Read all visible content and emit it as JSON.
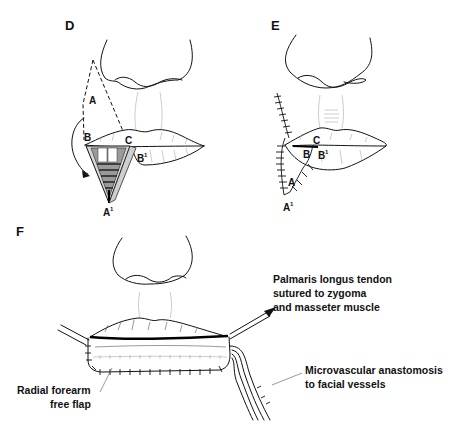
{
  "panels": {
    "D": {
      "label": "D",
      "points": {
        "A": "A",
        "B": "B",
        "C": "C",
        "B1": "B",
        "B1_sup": "1",
        "A1": "A",
        "A1_sup": "1"
      }
    },
    "E": {
      "label": "E",
      "points": {
        "A": "A",
        "B": "B",
        "C": "C",
        "B1": "B",
        "B1_sup": "1",
        "A1": "A",
        "A1_sup": "1"
      }
    },
    "F": {
      "label": "F",
      "callouts": {
        "tendon_line1": "Palmaris longus tendon",
        "tendon_line2": "sutured to zygoma",
        "tendon_line3": "and masseter muscle",
        "flap_line1": "Radial forearm",
        "flap_line2": "free flap",
        "vessel_line1": "Microvascular anastomosis",
        "vessel_line2": "to facial vessels"
      }
    }
  }
}
